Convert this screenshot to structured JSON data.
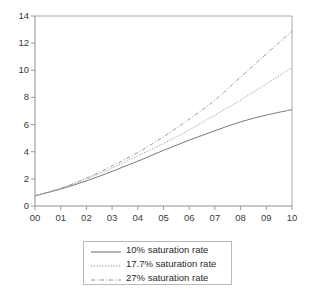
{
  "chart_data": {
    "type": "line",
    "title": "",
    "subtitle": "",
    "xlabel": "",
    "ylabel": "",
    "xlim": [
      0,
      10
    ],
    "ylim": [
      0,
      14
    ],
    "grid": false,
    "legend_position": "bottom-center",
    "x": [
      0,
      1,
      2,
      3,
      4,
      5,
      6,
      7,
      8,
      9,
      10
    ],
    "xtick_labels": [
      "00",
      "01",
      "02",
      "03",
      "04",
      "05",
      "06",
      "07",
      "08",
      "09",
      "10"
    ],
    "ytick_labels": [
      "0",
      "2",
      "4",
      "6",
      "8",
      "10",
      "12",
      "14"
    ],
    "ytick_values": [
      0,
      2,
      4,
      6,
      8,
      10,
      12,
      14
    ],
    "series": [
      {
        "name": "10% saturation rate",
        "line_style": "solid",
        "color": "#7a7a7a",
        "values": [
          0.75,
          1.25,
          1.85,
          2.55,
          3.3,
          4.1,
          4.85,
          5.55,
          6.2,
          6.7,
          7.1
        ]
      },
      {
        "name": "17.7% saturation rate",
        "line_style": "dotted",
        "color": "#9a9a9a",
        "values": [
          0.75,
          1.3,
          2.0,
          2.8,
          3.7,
          4.6,
          5.6,
          6.7,
          7.8,
          9.0,
          10.2
        ]
      },
      {
        "name": "27% saturation rate",
        "line_style": "dash-dot",
        "color": "#9a9a9a",
        "values": [
          0.75,
          1.3,
          2.05,
          2.95,
          3.95,
          5.1,
          6.4,
          7.8,
          9.5,
          11.2,
          12.9
        ]
      }
    ]
  },
  "legend": {
    "entries": [
      {
        "label": "10% saturation rate"
      },
      {
        "label": "17.7% saturation rate"
      },
      {
        "label": "27% saturation rate"
      }
    ]
  },
  "axes": {
    "frame_color": "#9a9a9a",
    "tick_color": "#9a9a9a",
    "label_color": "#3a3a3a"
  }
}
